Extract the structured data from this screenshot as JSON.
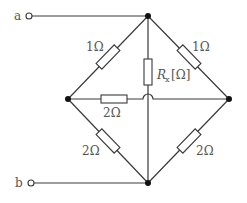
{
  "terminals": {
    "a": "a",
    "b": "b"
  },
  "resistors": {
    "top_left": "1Ω",
    "top_right": "1Ω",
    "middle": "2Ω",
    "bottom_left": "2Ω",
    "bottom_right": "2Ω",
    "center_vertical": {
      "symbol": "R",
      "subscript": "x",
      "unit": "[Ω]"
    }
  },
  "colors": {
    "wire": "#3a3a3a",
    "node": "#111111",
    "label": "#555555"
  }
}
